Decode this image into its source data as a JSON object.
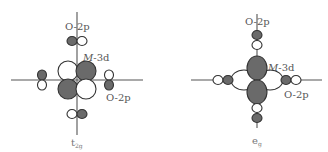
{
  "diagrams": [
    {
      "id": "t2g",
      "symmetry_label": "t",
      "symmetry_subscript": "2g",
      "metal_orbital_label_italic": "M",
      "metal_orbital_label_rest": "-3d",
      "ligand_label_top": "O-2p",
      "ligand_label_right": "O-2p"
    },
    {
      "id": "eg",
      "symmetry_label": "e",
      "symmetry_subscript": "g",
      "metal_orbital_label_italic": "M",
      "metal_orbital_label_rest": "-3d",
      "ligand_label_top": "O-2p",
      "ligand_label_right": "O-2p"
    }
  ],
  "colors": {
    "dark_lobe": "#6a6a6a",
    "light_lobe": "#ffffff",
    "outline": "#333333",
    "axis": "#555555"
  }
}
